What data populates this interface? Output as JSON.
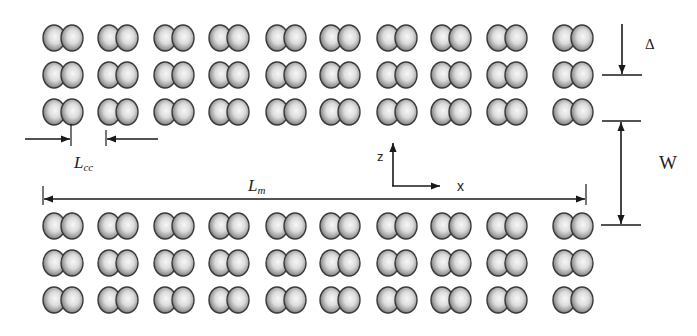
{
  "diagram": {
    "top_array": {
      "rows": 3,
      "columns": 10,
      "row_centers_y": [
        38,
        75,
        112
      ],
      "column_centers_x": [
        63,
        118,
        174,
        229,
        286,
        340,
        397,
        451,
        507,
        573
      ]
    },
    "bottom_array": {
      "rows": 3,
      "columns": 10,
      "row_centers_y": [
        226,
        263,
        300
      ],
      "column_centers_x": [
        63,
        118,
        174,
        229,
        286,
        340,
        397,
        451,
        507,
        573
      ]
    },
    "colors": {
      "line": "#1a1a1a",
      "sphere_edge": "#3a3a3a",
      "sphere_highlight": "#f4f4f4",
      "sphere_mid": "#b8b8b8",
      "background": "#ffffff"
    }
  },
  "labels": {
    "delta": "Δ",
    "width": "W",
    "lcc_main": "L",
    "lcc_sub": "cc",
    "lm_main": "L",
    "lm_sub": "m",
    "axis_z": "z",
    "axis_x": "x"
  },
  "dimensions": [
    {
      "name": "Delta",
      "meaning": "row spacing",
      "orientation": "vertical"
    },
    {
      "name": "W",
      "meaning": "gap between arrays",
      "orientation": "vertical"
    },
    {
      "name": "Lcc",
      "meaning": "column spacing",
      "orientation": "horizontal"
    },
    {
      "name": "Lm",
      "meaning": "array length",
      "orientation": "horizontal"
    }
  ]
}
